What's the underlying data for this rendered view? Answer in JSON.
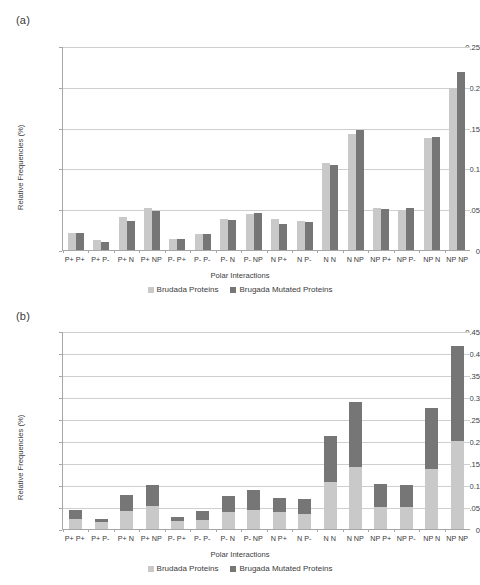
{
  "figure": {
    "panel_a_label": "(a)",
    "panel_b_label": "(b)"
  },
  "legend": {
    "series_light": "Brudada Proteins",
    "series_dark": "Brugada Mutated Proteins",
    "color_light": "#c9c9c9",
    "color_dark": "#767676"
  },
  "chart_data": [
    {
      "id": "panel-a",
      "type": "bar",
      "title": "(a)",
      "xlabel": "Polar Interactions",
      "ylabel": "Relative Frequencies (%)",
      "ylim": [
        0,
        0.25
      ],
      "yticks": [
        "0",
        "0.05",
        "0.1",
        "0.15",
        "0.2",
        "0.25"
      ],
      "ytick_values": [
        0,
        0.05,
        0.1,
        0.15,
        0.2,
        0.25
      ],
      "grid": true,
      "legend_position": "bottom",
      "categories": [
        "P+ P+",
        "P+ P-",
        "P+ N",
        "P+ NP",
        "P- P+",
        "P- P-",
        "P- N",
        "P- NP",
        "N P+",
        "N P-",
        "N N",
        "N NP",
        "NP P+",
        "NP P-",
        "NP N",
        "NP NP"
      ],
      "series": [
        {
          "name": "Brudada Proteins",
          "color": "#c9c9c9",
          "values": [
            0.021,
            0.012,
            0.04,
            0.051,
            0.014,
            0.02,
            0.038,
            0.044,
            0.038,
            0.035,
            0.107,
            0.142,
            0.051,
            0.049,
            0.137,
            0.199
          ]
        },
        {
          "name": "Brugada Mutated Proteins",
          "color": "#767676",
          "values": [
            0.021,
            0.01,
            0.036,
            0.048,
            0.013,
            0.02,
            0.037,
            0.045,
            0.032,
            0.034,
            0.104,
            0.147,
            0.05,
            0.052,
            0.139,
            0.218
          ]
        }
      ]
    },
    {
      "id": "panel-b",
      "type": "bar",
      "stacked": true,
      "title": "(b)",
      "xlabel": "Polar Interactions",
      "ylabel": "Relative Frequencies (%)",
      "ylim": [
        0,
        0.45
      ],
      "yticks": [
        "0",
        "0.05",
        "0.1",
        "0.15",
        "0.2",
        "0.25",
        "0.3",
        "0.35",
        "0.4",
        "0.45"
      ],
      "ytick_values": [
        0,
        0.05,
        0.1,
        0.15,
        0.2,
        0.25,
        0.3,
        0.35,
        0.4,
        0.45
      ],
      "grid": true,
      "legend_position": "bottom",
      "categories": [
        "P+ P+",
        "P+ P-",
        "P+ N",
        "P+ NP",
        "P- P+",
        "P- P-",
        "P- N",
        "P- NP",
        "N P+",
        "N P-",
        "N N",
        "N NP",
        "NP P+",
        "NP P-",
        "NP N",
        "NP NP"
      ],
      "series": [
        {
          "name": "Brudada Proteins",
          "color": "#c9c9c9",
          "values": [
            0.022,
            0.017,
            0.04,
            0.052,
            0.018,
            0.021,
            0.038,
            0.044,
            0.038,
            0.035,
            0.107,
            0.141,
            0.051,
            0.049,
            0.137,
            0.199
          ]
        },
        {
          "name": "Brugada Mutated Proteins",
          "color": "#767676",
          "values": [
            0.021,
            0.005,
            0.037,
            0.048,
            0.01,
            0.02,
            0.037,
            0.045,
            0.032,
            0.034,
            0.104,
            0.147,
            0.051,
            0.052,
            0.138,
            0.217
          ]
        }
      ],
      "totals": [
        0.043,
        0.022,
        0.077,
        0.1,
        0.028,
        0.041,
        0.075,
        0.089,
        0.07,
        0.069,
        0.211,
        0.288,
        0.102,
        0.101,
        0.275,
        0.416
      ]
    }
  ]
}
